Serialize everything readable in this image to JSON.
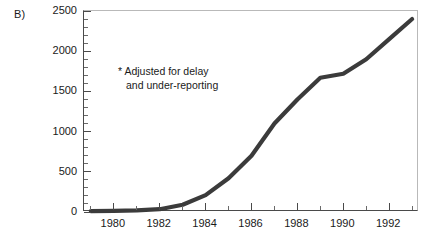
{
  "panel": {
    "label": "B)"
  },
  "annotation": {
    "line1": "* Adjusted for delay",
    "line2": "and under-reporting"
  },
  "colors": {
    "curve": "#3b3b3b",
    "axis": "#4a4a4a",
    "text": "#1a1a1a",
    "background": "#ffffff"
  },
  "chart_data": {
    "type": "line",
    "title": "",
    "xlabel": "",
    "ylabel": "",
    "xlim": [
      1978.7,
      1993.3
    ],
    "ylim": [
      0,
      2500
    ],
    "grid": false,
    "legend": "none",
    "annotations": [
      "* Adjusted for delay",
      "and under-reporting"
    ],
    "y_ticks_major": [
      0,
      500,
      1000,
      1500,
      2000,
      2500
    ],
    "y_tick_labels": [
      "0",
      "500",
      "1000",
      "1500",
      "2000",
      "2500"
    ],
    "y_minor_step": 100,
    "x_ticks_major": [
      1980,
      1982,
      1984,
      1986,
      1988,
      1990,
      1992
    ],
    "x_tick_labels": [
      "1980",
      "1982",
      "1984",
      "1986",
      "1988",
      "1990",
      "1992"
    ],
    "x_minor_step": 1,
    "series": [
      {
        "name": "Reported cases (adjusted)",
        "x": [
          1979,
          1980,
          1981,
          1982,
          1983,
          1984,
          1985,
          1986,
          1987,
          1988,
          1989,
          1990,
          1991,
          1992,
          1993
        ],
        "values": [
          10,
          15,
          20,
          35,
          90,
          210,
          420,
          700,
          1100,
          1400,
          1670,
          1720,
          1900,
          2150,
          2400
        ]
      }
    ]
  }
}
